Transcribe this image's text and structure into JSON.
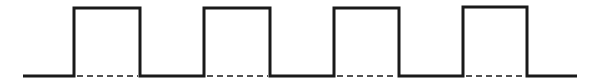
{
  "diagram": {
    "type": "square-wave",
    "stroke_color": "#1a1a1a",
    "background": "#ffffff",
    "stroke_width": 3,
    "baseline": {
      "x_start": 23,
      "x_end": 577,
      "y": 76
    },
    "high_level_y": 8,
    "pulses": [
      {
        "x_rise": 74,
        "x_fall": 140,
        "y_top": 8
      },
      {
        "x_rise": 204,
        "x_fall": 270,
        "y_top": 8
      },
      {
        "x_rise": 334,
        "x_fall": 399,
        "y_top": 8
      },
      {
        "x_rise": 463,
        "x_fall": 527,
        "y_top": 7
      }
    ],
    "dashed_reference": {
      "dash": "6 4",
      "stroke_width": 1.5
    }
  }
}
